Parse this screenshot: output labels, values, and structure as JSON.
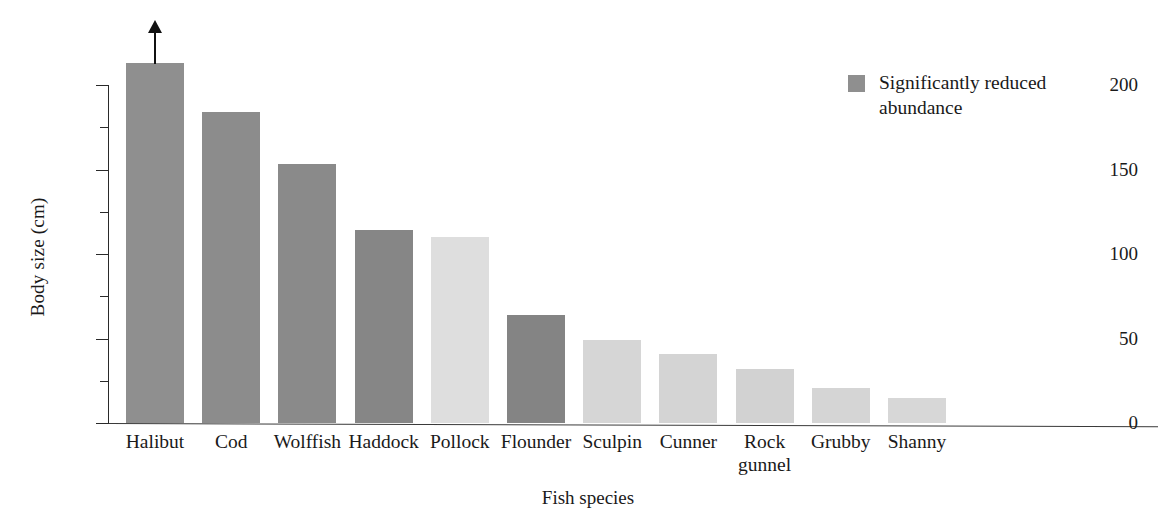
{
  "chart_data": {
    "type": "bar",
    "title": "",
    "xlabel": "Fish species",
    "ylabel": "Body size (cm)",
    "ylim": [
      0,
      215
    ],
    "grid": false,
    "y_major_ticks": [
      0,
      50,
      100,
      150,
      200
    ],
    "y_minor_ticks": [
      25,
      75,
      125,
      175
    ],
    "y_tick_labels": [
      "0",
      "50",
      "100",
      "150",
      "200"
    ],
    "categories": [
      "Halibut",
      "Cod",
      "Wolffish",
      "Haddock",
      "Pollock",
      "Flounder",
      "Sculpin",
      "Cunner",
      "Rock\ngunnel",
      "Grubby",
      "Shanny"
    ],
    "values": [
      213,
      184,
      153,
      114,
      110,
      64,
      49,
      41,
      32,
      21,
      15
    ],
    "bar_colors": [
      "#8f8f8f",
      "#8c8c8c",
      "#8a8a8a",
      "#868686",
      "#dedede",
      "#848484",
      "#d6d6d6",
      "#d4d4d4",
      "#d2d2d2",
      "#d5d5d5",
      "#d7d7d7"
    ],
    "annotations": [
      {
        "category": "Halibut",
        "type": "up-arrow",
        "note": "value extends beyond axis"
      }
    ],
    "legend": {
      "position": "top-right",
      "entries": [
        {
          "label": "Significantly reduced\nabundance",
          "color": "#8f8f8f"
        }
      ]
    }
  }
}
